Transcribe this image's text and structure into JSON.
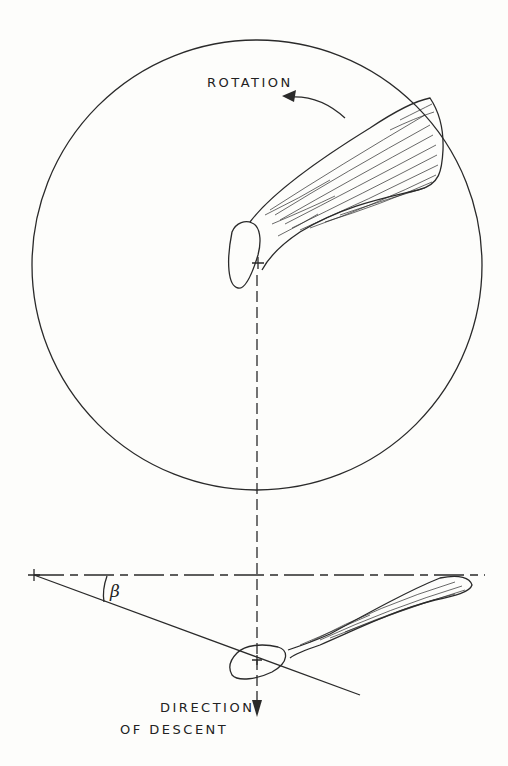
{
  "figure": {
    "top_view": {
      "rotation_label": "ROTATION",
      "circle": {
        "cx": 257,
        "cy": 265,
        "r": 225
      }
    },
    "side_view": {
      "angle_label": "β",
      "descent_label_line1": "DIRECTION",
      "descent_label_line2": "OF DESCENT"
    },
    "colors": {
      "ink": "#2a2a2a",
      "background": "#fdfdfb"
    }
  }
}
